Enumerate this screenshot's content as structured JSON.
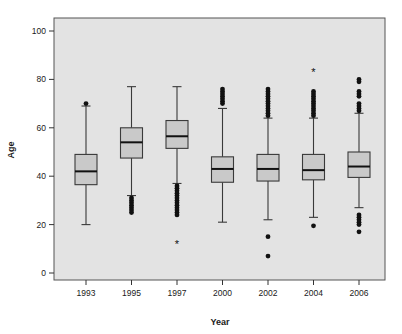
{
  "chart_data": {
    "type": "box",
    "title": "",
    "xlabel": "Year",
    "ylabel": "Age",
    "categories": [
      "1993",
      "1995",
      "1997",
      "2000",
      "2002",
      "2004",
      "2006"
    ],
    "ylim": [
      0,
      105
    ],
    "yticks": [
      0,
      20,
      40,
      60,
      80,
      100
    ],
    "ytick_labels": [
      "0",
      "20",
      "40",
      "60",
      "80",
      "100"
    ],
    "grid": false,
    "legend": "none",
    "plot_background": "#e3e3e3",
    "box_fill": "#c9c9c9",
    "box_stroke": "#3a3a3a",
    "outlier_color": "#111111",
    "boxes": [
      {
        "category": "1993",
        "whisker_low": 20,
        "q1": 36.5,
        "median": 42,
        "q3": 49,
        "whisker_high": 69,
        "outliers": [
          70
        ],
        "extremes": []
      },
      {
        "category": "1995",
        "whisker_low": 32,
        "q1": 47.5,
        "median": 54,
        "q3": 60,
        "whisker_high": 77,
        "outliers": [
          31,
          30,
          29,
          28,
          27,
          26,
          25
        ],
        "extremes": []
      },
      {
        "category": "1997",
        "whisker_low": 37,
        "q1": 51.5,
        "median": 56.5,
        "q3": 63,
        "whisker_high": 77,
        "outliers": [
          36,
          35,
          34,
          33,
          32,
          31,
          30,
          29,
          28,
          27,
          26,
          25,
          24
        ],
        "extremes": [
          12
        ]
      },
      {
        "category": "2000",
        "whisker_low": 21,
        "q1": 37.5,
        "median": 43,
        "q3": 48,
        "whisker_high": 68,
        "outliers": [
          76,
          75,
          74,
          73,
          72,
          71,
          70
        ],
        "extremes": []
      },
      {
        "category": "2002",
        "whisker_low": 22,
        "q1": 38,
        "median": 43,
        "q3": 49,
        "whisker_high": 64,
        "outliers": [
          76,
          75,
          74,
          73,
          72,
          71,
          70,
          69,
          68,
          67,
          66,
          65,
          15,
          7
        ],
        "extremes": []
      },
      {
        "category": "2004",
        "whisker_low": 23,
        "q1": 38.5,
        "median": 42.5,
        "q3": 49,
        "whisker_high": 64,
        "outliers": [
          75,
          74,
          73,
          72,
          71,
          70,
          69,
          68,
          67,
          66,
          65,
          19.5
        ],
        "extremes": [
          83
        ]
      },
      {
        "category": "2006",
        "whisker_low": 27,
        "q1": 39.5,
        "median": 44,
        "q3": 50,
        "whisker_high": 66,
        "outliers": [
          80,
          79,
          75,
          74,
          73,
          70,
          69,
          68,
          67,
          24,
          23,
          22,
          21,
          20,
          17
        ],
        "extremes": []
      }
    ]
  }
}
